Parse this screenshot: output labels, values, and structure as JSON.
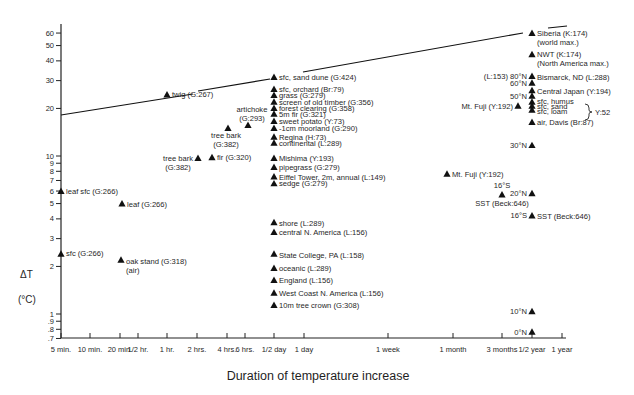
{
  "chart_data": {
    "type": "scatter",
    "title": "",
    "xlabel": "Duration of temperature increase",
    "ylabel": "ΔT",
    "ylabel_unit": "(°C)",
    "yscale": "log",
    "xscale": "log",
    "ylim": [
      0.7,
      65
    ],
    "xlim": [
      "5 min.",
      "1 year"
    ],
    "grid": false,
    "legend": null,
    "marker": "filled-triangle",
    "y_ticks": [
      {
        "label": "60",
        "value": 60
      },
      {
        "label": "50",
        "value": 50
      },
      {
        "label": "40",
        "value": 40
      },
      {
        "label": "30",
        "value": 30
      },
      {
        "label": "20",
        "value": 20
      },
      {
        "label": "10",
        "value": 10
      },
      {
        "label": "9",
        "value": 9
      },
      {
        "label": "8",
        "value": 8
      },
      {
        "label": "7",
        "value": 7
      },
      {
        "label": "6",
        "value": 6
      },
      {
        "label": "5",
        "value": 5
      },
      {
        "label": "4",
        "value": 4
      },
      {
        "label": "3",
        "value": 3
      },
      {
        "label": "2",
        "value": 2
      },
      {
        "label": "1",
        "value": 1
      },
      {
        "label": ".9",
        "value": 0.9
      },
      {
        "label": ".8",
        "value": 0.8
      },
      {
        "label": ".7",
        "value": 0.7
      }
    ],
    "x_ticks": [
      {
        "label": "5 min.",
        "px": 61
      },
      {
        "label": "10 min.",
        "px": 90
      },
      {
        "label": "20 min.",
        "px": 120
      },
      {
        "label": "1/2 hr.",
        "px": 138
      },
      {
        "label": "1 hr.",
        "px": 167
      },
      {
        "label": "2 hrs.",
        "px": 197
      },
      {
        "label": "4 hrs.",
        "px": 227
      },
      {
        "label": "6 hrs.",
        "px": 245
      },
      {
        "label": "1/2 day",
        "px": 274
      },
      {
        "label": "1 day",
        "px": 304
      },
      {
        "label": "1 week",
        "px": 388
      },
      {
        "label": "1 month",
        "px": 453
      },
      {
        "label": "3 months",
        "px": 502
      },
      {
        "label": "1/2 year",
        "px": 532
      },
      {
        "label": "1 year",
        "px": 562
      }
    ],
    "trend_line": {
      "description": "upper envelope of maximum temperature increase",
      "segments": [
        [
          [
            61,
            115
          ],
          [
            193,
            94
          ]
        ],
        [
          [
            198,
            91
          ],
          [
            270,
            79
          ]
        ],
        [
          [
            303,
            72
          ],
          [
            523,
            33
          ]
        ],
        [
          [
            548,
            28
          ],
          [
            567,
            26
          ]
        ]
      ]
    },
    "points": [
      {
        "label": "leaf sfc (G:266)",
        "duration": "5 min.",
        "dT": 6.0,
        "x": 61,
        "lx": 66,
        "ly": 194,
        "anchor": "start"
      },
      {
        "label": "sfc (G:266)",
        "duration": "5 min.",
        "dT": 2.4,
        "x": 61,
        "lx": 66,
        "ly": 256,
        "anchor": "start"
      },
      {
        "label": "leaf (G:266)",
        "duration": "20 min.",
        "dT": 5.0,
        "x": 122,
        "lx": 127,
        "ly": 207,
        "anchor": "start"
      },
      {
        "label": "oak stand (G:318)",
        "label2": "(air)",
        "duration": "20 min.",
        "dT": 2.2,
        "x": 121,
        "lx": 126,
        "ly": 264,
        "anchor": "start"
      },
      {
        "label": "twig (G:267)",
        "duration": "1 hr.",
        "dT": 24.5,
        "x": 167,
        "lx": 172,
        "ly": 97,
        "anchor": "start"
      },
      {
        "label": "artichoke",
        "label2": "(G:293)",
        "duration": "~5 hrs.",
        "dT": 15.7,
        "x": 248,
        "lx": 252,
        "ly": 112,
        "ly2": 121,
        "anchor": "middle",
        "above": true
      },
      {
        "label": "tree bark",
        "label2": "(G:382)",
        "duration": "~4 hrs.",
        "dT": 15.0,
        "x": 228,
        "lx": 226,
        "ly": 138,
        "ly2": 147,
        "anchor": "middle",
        "below": true
      },
      {
        "label": "tree bark",
        "label2": "(G:382)",
        "duration": "~2 hrs.",
        "dT": 9.7,
        "x": 198,
        "lx": 178,
        "ly": 161,
        "ly2": 170,
        "anchor": "middle",
        "left": true
      },
      {
        "label": "fir (G:320)",
        "duration": "~3 hrs.",
        "dT": 9.8,
        "x": 212,
        "lx": 217,
        "ly": 160,
        "anchor": "start"
      },
      {
        "label": "sfc, sand dune (G:424)",
        "duration": "1/2 day",
        "dT": 31.6,
        "x": 274,
        "lx": 279,
        "ly": 80,
        "anchor": "start"
      },
      {
        "label": "sfc, orchard (Br:79)",
        "duration": "1/2 day",
        "dT": 26.5,
        "x": 274,
        "lx": 279,
        "ly": 92,
        "anchor": "start"
      },
      {
        "label": "grass (G:279)",
        "duration": "1/2 day",
        "dT": 24.3,
        "x": 274,
        "lx": 279,
        "ly": 98,
        "anchor": "start"
      },
      {
        "label": "screen of old timber (G:356)",
        "duration": "1/2 day",
        "dT": 22.0,
        "x": 274,
        "lx": 279,
        "ly": 105,
        "anchor": "start"
      },
      {
        "label": "forest clearing (G:358)",
        "duration": "1/2 day",
        "dT": 20.1,
        "x": 274,
        "lx": 279,
        "ly": 111,
        "anchor": "start"
      },
      {
        "label": "5m fir (G:321)",
        "duration": "1/2 day",
        "dT": 18.5,
        "x": 274,
        "lx": 279,
        "ly": 117,
        "anchor": "start"
      },
      {
        "label": "sweet potato (Y:73)",
        "duration": "1/2 day",
        "dT": 16.6,
        "x": 274,
        "lx": 279,
        "ly": 124,
        "anchor": "start"
      },
      {
        "label": "-1cm moorland (G:290)",
        "duration": "1/2 day",
        "dT": 15.0,
        "x": 274,
        "lx": 279,
        "ly": 131,
        "anchor": "start"
      },
      {
        "label": "Regina (H:73)",
        "duration": "1/2 day",
        "dT": 13.2,
        "x": 274,
        "lx": 279,
        "ly": 140,
        "anchor": "start"
      },
      {
        "label": "continental (L:289)",
        "duration": "1/2 day",
        "dT": 12.1,
        "x": 274,
        "lx": 279,
        "ly": 146,
        "anchor": "start"
      },
      {
        "label": "Mishima (Y:193)",
        "duration": "1/2 day",
        "dT": 9.7,
        "x": 274,
        "lx": 279,
        "ly": 161,
        "anchor": "start"
      },
      {
        "label": "pipegrass (G:279)",
        "duration": "1/2 day",
        "dT": 8.5,
        "x": 274,
        "lx": 279,
        "ly": 170,
        "anchor": "start"
      },
      {
        "label": "Eiffel Tower, 2m, annual (L:149)",
        "duration": "1/2 day",
        "dT": 7.4,
        "x": 274,
        "lx": 279,
        "ly": 180,
        "anchor": "start"
      },
      {
        "label": "sedge (G:279)",
        "duration": "1/2 day",
        "dT": 6.7,
        "x": 274,
        "lx": 279,
        "ly": 186,
        "anchor": "start"
      },
      {
        "label": "shore (L:289)",
        "duration": "1/2 day",
        "dT": 3.8,
        "x": 274,
        "lx": 279,
        "ly": 226,
        "anchor": "start"
      },
      {
        "label": "central N. America (L:156)",
        "duration": "1/2 day",
        "dT": 3.3,
        "x": 274,
        "lx": 279,
        "ly": 235,
        "anchor": "start"
      },
      {
        "label": "State College, PA (L:158)",
        "duration": "1/2 day",
        "dT": 2.4,
        "x": 274,
        "lx": 279,
        "ly": 258,
        "anchor": "start"
      },
      {
        "label": "oceanic (L:289)",
        "duration": "1/2 day",
        "dT": 1.95,
        "x": 274,
        "lx": 279,
        "ly": 271,
        "anchor": "start"
      },
      {
        "label": "England (L:156)",
        "duration": "1/2 day",
        "dT": 1.64,
        "x": 274,
        "lx": 279,
        "ly": 283,
        "anchor": "start"
      },
      {
        "label": "West Coast N. America (L:156)",
        "duration": "1/2 day",
        "dT": 1.36,
        "x": 274,
        "lx": 279,
        "ly": 296,
        "anchor": "start"
      },
      {
        "label": "10m tree crown (G:308)",
        "duration": "1/2 day",
        "dT": 1.14,
        "x": 274,
        "lx": 279,
        "ly": 308,
        "anchor": "start"
      },
      {
        "label": "Mt. Fuji (Y:192)",
        "duration": "~1 month",
        "dT": 7.7,
        "x": 447,
        "lx": 452,
        "ly": 177,
        "anchor": "start"
      },
      {
        "label": "16°S",
        "label2": "SST (Beck:646)",
        "duration": "~3 months",
        "dT": 5.7,
        "x": 502,
        "lx": 502,
        "ly": 188,
        "ly2": 206,
        "anchor": "middle",
        "split": true
      },
      {
        "label": "Siberia (K:174)",
        "label2": "(world max.)",
        "duration": "1/2 year",
        "dT": 60,
        "x": 532,
        "lx": 537,
        "ly": 36,
        "ly2": 45,
        "anchor": "start"
      },
      {
        "label": "NWT (K:174)",
        "label2": "(North America max.)",
        "duration": "1/2 year",
        "dT": 44,
        "x": 532,
        "lx": 537,
        "ly": 57,
        "ly2": 66,
        "anchor": "start"
      },
      {
        "label": "Bismarck, ND (L:288)",
        "pre": "(L:153) 80°N",
        "duration": "1/2 year",
        "dT": 32,
        "x": 532,
        "lx": 537,
        "ly": 80,
        "anchor": "start"
      },
      {
        "label": "",
        "pre": "60°N",
        "duration": "1/2 year",
        "dT": 29,
        "x": 532,
        "ly": 86,
        "anchor": "start"
      },
      {
        "label": "Central Japan (Y:194)",
        "duration": "1/2 year",
        "dT": 26,
        "x": 532,
        "lx": 537,
        "ly": 94,
        "anchor": "start"
      },
      {
        "label": "",
        "pre": "50°N",
        "duration": "1/2 year",
        "dT": 24,
        "x": 532,
        "ly": 99,
        "anchor": "start"
      },
      {
        "label": "sfc, humus",
        "duration": "1/2 year",
        "dT": 22,
        "x": 532,
        "lx": 537,
        "ly": 104,
        "anchor": "start"
      },
      {
        "label": "sfc, sand",
        "duration": "1/2 year",
        "dT": 20.8,
        "x": 532,
        "lx": 537,
        "ly": 109,
        "anchor": "start"
      },
      {
        "label": "sfc, loam",
        "duration": "1/2 year",
        "dT": 19.6,
        "x": 532,
        "lx": 537,
        "ly": 114,
        "anchor": "start"
      },
      {
        "label": "",
        "pre": "Mt. Fuji (Y:192)",
        "duration": "~5 months",
        "dT": 20.8,
        "x": 518,
        "ly": 109,
        "anchor": "start"
      },
      {
        "label": "air, Davis (Br:87)",
        "duration": "1/2 year",
        "dT": 16.4,
        "x": 532,
        "lx": 537,
        "ly": 125,
        "anchor": "start"
      },
      {
        "label": "",
        "pre": "30°N",
        "duration": "1/2 year",
        "dT": 11.7,
        "x": 532,
        "ly": 148,
        "anchor": "start"
      },
      {
        "label": "",
        "pre": "20°N",
        "duration": "1/2 year",
        "dT": 5.8,
        "x": 532,
        "ly": 196,
        "anchor": "start"
      },
      {
        "label": "SST (Beck:646)",
        "pre": "16°S",
        "duration": "1/2 year",
        "dT": 4.2,
        "x": 532,
        "lx": 537,
        "ly": 219,
        "anchor": "start"
      },
      {
        "label": "",
        "pre": "10°N",
        "duration": "1/2 year",
        "dT": 1.04,
        "x": 532,
        "ly": 314,
        "anchor": "start"
      },
      {
        "label": "",
        "pre": "0°N",
        "duration": "1/2 year",
        "dT": 0.77,
        "x": 532,
        "ly": 335,
        "anchor": "start"
      }
    ],
    "bracket": {
      "label": "Y:52",
      "groups": [
        "sfc, humus",
        "sfc, sand",
        "sfc, loam"
      ]
    }
  },
  "axis": {
    "y_title": "ΔT",
    "y_unit": "(°C)",
    "x_title": "Duration of temperature increase"
  }
}
